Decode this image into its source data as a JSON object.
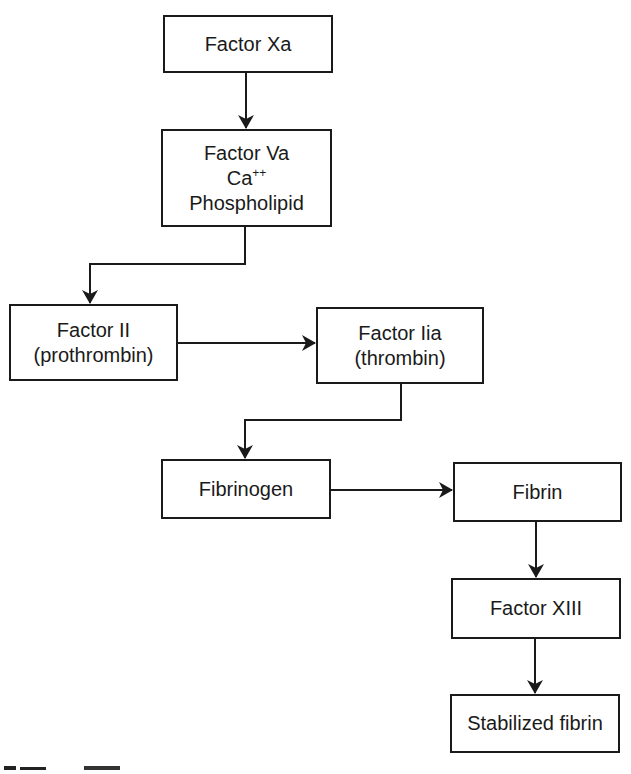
{
  "diagram": {
    "type": "flowchart",
    "colors": {
      "line": "#1a1a1a",
      "box_fill": "#ffffff",
      "background": "#ffffff"
    },
    "nodes": {
      "factor_xa": {
        "lines": [
          "Factor Xa"
        ]
      },
      "factor_va_complex": {
        "lines": [
          "Factor Va",
          "Ca",
          "Phospholipid"
        ],
        "ca_superscript": "++"
      },
      "factor_ii": {
        "lines": [
          "Factor II",
          "(prothrombin)"
        ]
      },
      "factor_iia": {
        "lines": [
          "Factor Iia",
          "(thrombin)"
        ]
      },
      "fibrinogen": {
        "lines": [
          "Fibrinogen"
        ]
      },
      "fibrin": {
        "lines": [
          "Fibrin"
        ]
      },
      "factor_xiii": {
        "lines": [
          "Factor XIII"
        ]
      },
      "stabilized_fibrin": {
        "lines": [
          "Stabilized fibrin"
        ]
      }
    },
    "edges": [
      {
        "from": "factor_xa",
        "to": "factor_va_complex"
      },
      {
        "from": "factor_va_complex",
        "to": "factor_ii"
      },
      {
        "from": "factor_ii",
        "to": "factor_iia"
      },
      {
        "from": "factor_iia",
        "to": "fibrinogen"
      },
      {
        "from": "fibrinogen",
        "to": "fibrin"
      },
      {
        "from": "fibrin",
        "to": "factor_xiii"
      },
      {
        "from": "factor_xiii",
        "to": "stabilized_fibrin"
      }
    ]
  }
}
